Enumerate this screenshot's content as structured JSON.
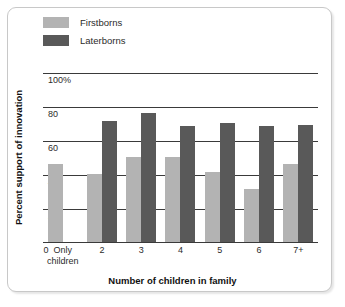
{
  "chart_data": {
    "type": "bar",
    "title": "",
    "xlabel": "Number of children in family",
    "ylabel": "Percent support of innovation",
    "categories": [
      "Only children",
      "2",
      "3",
      "4",
      "5",
      "6",
      "7+"
    ],
    "xtick_labels": [
      "0",
      "Only\nchildren",
      "2",
      "3",
      "4",
      "5",
      "6",
      "7+"
    ],
    "series": [
      {
        "name": "Firstborns",
        "color": "#b3b3b3",
        "values": [
          46,
          40,
          50,
          50,
          41,
          31,
          46
        ]
      },
      {
        "name": "Laterborns",
        "color": "#595959",
        "values": [
          null,
          71,
          76,
          68,
          70,
          68,
          69
        ]
      }
    ],
    "ylim": [
      0,
      110
    ],
    "yticks": [
      20,
      40,
      60,
      80,
      100
    ],
    "ytick_labels": [
      "20",
      "40",
      "60",
      "80",
      "100%"
    ],
    "grid": true,
    "legend_position": "top-left"
  },
  "legend": {
    "items": [
      {
        "label": "Firstborns",
        "color": "#b3b3b3"
      },
      {
        "label": "Laterborns",
        "color": "#595959"
      }
    ]
  },
  "axes": {
    "x_title": "Number of children in family",
    "y_title": "Percent support of innovation",
    "y_labels": [
      "100%",
      "80",
      "60",
      "40",
      "20"
    ],
    "x_labels": [
      "0",
      "Only",
      "children",
      "2",
      "3",
      "4",
      "5",
      "6",
      "7+"
    ]
  }
}
